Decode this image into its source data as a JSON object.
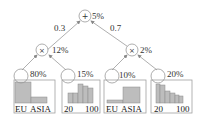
{
  "diagram": {
    "type": "sum-product network",
    "root": {
      "op": "+",
      "prob": "5%"
    },
    "edges": {
      "left_weight": "0.3",
      "right_weight": "0.7"
    },
    "products": [
      {
        "op": "×",
        "prob": "12%"
      },
      {
        "op": "×",
        "prob": "2%"
      }
    ],
    "leaves": [
      {
        "prob": "80%",
        "kind": "categorical",
        "axis_left": "EU",
        "axis_right": "ASIA",
        "bars": [
          0.9,
          0.28
        ]
      },
      {
        "prob": "15%",
        "kind": "histogram",
        "axis_left": "20",
        "axis_right": "100",
        "bars": [
          0.45,
          0.45,
          0.85,
          0.75,
          0.65
        ]
      },
      {
        "prob": "10%",
        "kind": "categorical",
        "axis_left": "EU",
        "axis_right": "ASIA",
        "bars": [
          0.15,
          0.75
        ]
      },
      {
        "prob": "20%",
        "kind": "histogram",
        "axis_left": "20",
        "axis_right": "100",
        "bars": [
          0.85,
          0.8,
          0.55,
          0.45,
          0.35,
          0.3
        ]
      }
    ],
    "colors": {
      "stroke": "#9a9a9a",
      "bar_fill": "#bdbdbd",
      "bar_stroke": "#8a8a8a",
      "box_stroke": "#a0a0a0"
    }
  }
}
